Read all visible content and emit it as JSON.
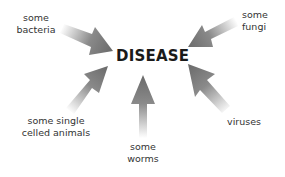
{
  "diagram": {
    "center": {
      "label": "DISEASE"
    },
    "causes": [
      {
        "id": "bacteria",
        "lines": [
          "some",
          "bacteria"
        ]
      },
      {
        "id": "fungi",
        "lines": [
          "some",
          "fungi"
        ]
      },
      {
        "id": "single-celled-animals",
        "lines": [
          "some single",
          "celled animals"
        ]
      },
      {
        "id": "worms",
        "lines": [
          "some",
          "worms"
        ]
      },
      {
        "id": "viruses",
        "lines": [
          "viruses"
        ]
      }
    ],
    "colors": {
      "arrow_head": "#6e6e6e",
      "arrow_tail_fade": "#ffffff",
      "text": "#333333",
      "center_text": "#1a1a1a"
    }
  }
}
